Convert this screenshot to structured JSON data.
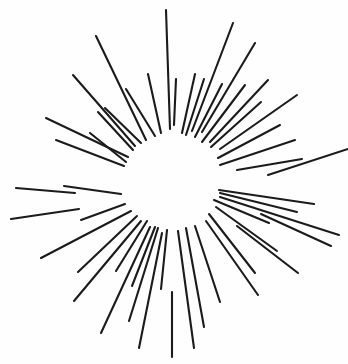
{
  "figure": {
    "kind": "radial-sunburst-line-drawing",
    "width": 348,
    "height": 364,
    "background_color": "#fefefe",
    "stroke_color": "#1b1b1b",
    "stroke_width": 2.1,
    "center": {
      "x": 172,
      "y": 182
    },
    "ray_count": 40,
    "inner_radius_range": [
      46,
      60
    ],
    "outer_radius_range": [
      78,
      175
    ]
  },
  "chart_data": {
    "type": "scatter",
    "subtitle": "",
    "xlabel": "",
    "ylabel": "",
    "grid": false,
    "legend": null,
    "xlim": [
      0,
      348
    ],
    "ylim": [
      0,
      364
    ],
    "center": {
      "x": 172,
      "y": 182
    },
    "units": "pixels",
    "angle_convention": "degrees, 0 = up (12 o'clock), increasing clockwise",
    "annotations": [],
    "rays": [
      {
        "angle": 358,
        "inner_r": 53,
        "outer_r": 172,
        "x1": 170,
        "y1": 129,
        "x2": 166,
        "y2": 10
      },
      {
        "angle": 2,
        "inner_r": 57,
        "outer_r": 103,
        "x1": 174,
        "y1": 125,
        "x2": 176,
        "y2": 79
      },
      {
        "angle": 12,
        "inner_r": 50,
        "outer_r": 110,
        "x1": 182,
        "y1": 133,
        "x2": 195,
        "y2": 74
      },
      {
        "angle": 17,
        "inner_r": 49,
        "outer_r": 108,
        "x1": 186,
        "y1": 135,
        "x2": 204,
        "y2": 79
      },
      {
        "angle": 21,
        "inner_r": 55,
        "outer_r": 170,
        "x1": 192,
        "y1": 131,
        "x2": 233,
        "y2": 23
      },
      {
        "angle": 27,
        "inner_r": 50,
        "outer_r": 110,
        "x1": 195,
        "y1": 137,
        "x2": 222,
        "y2": 84
      },
      {
        "angle": 31,
        "inner_r": 58,
        "outer_r": 162,
        "x1": 202,
        "y1": 132,
        "x2": 255,
        "y2": 43
      },
      {
        "angle": 37,
        "inner_r": 50,
        "outer_r": 122,
        "x1": 202,
        "y1": 142,
        "x2": 245,
        "y2": 85
      },
      {
        "angle": 43,
        "inner_r": 55,
        "outer_r": 140,
        "x1": 210,
        "y1": 142,
        "x2": 268,
        "y2": 80
      },
      {
        "angle": 48,
        "inner_r": 52,
        "outer_r": 120,
        "x1": 211,
        "y1": 147,
        "x2": 261,
        "y2": 102
      },
      {
        "angle": 55,
        "inner_r": 58,
        "outer_r": 152,
        "x1": 220,
        "y1": 149,
        "x2": 297,
        "y2": 95
      },
      {
        "angle": 62,
        "inner_r": 52,
        "outer_r": 122,
        "x1": 218,
        "y1": 158,
        "x2": 280,
        "y2": 125
      },
      {
        "angle": 71,
        "inner_r": 51,
        "outer_r": 130,
        "x1": 220,
        "y1": 165,
        "x2": 295,
        "y2": 140
      },
      {
        "angle": 80,
        "inner_r": 66,
        "outer_r": 132,
        "x1": 237,
        "y1": 170,
        "x2": 302,
        "y2": 159
      },
      {
        "angle": 86,
        "inner_r": 96,
        "outer_r": 176,
        "x1": 268,
        "y1": 175,
        "x2": 348,
        "y2": 149
      },
      {
        "angle": 99,
        "inner_r": 48,
        "outer_r": 144,
        "x1": 219,
        "y1": 190,
        "x2": 314,
        "y2": 204
      },
      {
        "angle": 103,
        "inner_r": 49,
        "outer_r": 128,
        "x1": 220,
        "y1": 193,
        "x2": 297,
        "y2": 212
      },
      {
        "angle": 107,
        "inner_r": 50,
        "outer_r": 175,
        "x1": 220,
        "y1": 197,
        "x2": 339,
        "y2": 235
      },
      {
        "angle": 110,
        "inner_r": 95,
        "outer_r": 170,
        "x1": 261,
        "y1": 214,
        "x2": 331,
        "y2": 246
      },
      {
        "angle": 113,
        "inner_r": 46,
        "outer_r": 106,
        "x1": 214,
        "y1": 200,
        "x2": 269,
        "y2": 223
      },
      {
        "angle": 119,
        "inner_r": 50,
        "outer_r": 122,
        "x1": 216,
        "y1": 207,
        "x2": 277,
        "y2": 251
      },
      {
        "angle": 125,
        "inner_r": 80,
        "outer_r": 155,
        "x1": 237,
        "y1": 226,
        "x2": 298,
        "y2": 273
      },
      {
        "angle": 131,
        "inner_r": 49,
        "outer_r": 112,
        "x1": 209,
        "y1": 214,
        "x2": 255,
        "y2": 273
      },
      {
        "angle": 139,
        "inner_r": 52,
        "outer_r": 130,
        "x1": 206,
        "y1": 221,
        "x2": 258,
        "y2": 295
      },
      {
        "angle": 152,
        "inner_r": 50,
        "outer_r": 136,
        "x1": 195,
        "y1": 226,
        "x2": 220,
        "y2": 302
      },
      {
        "angle": 163,
        "inner_r": 48,
        "outer_r": 152,
        "x1": 186,
        "y1": 228,
        "x2": 204,
        "y2": 327
      },
      {
        "angle": 173,
        "inner_r": 50,
        "outer_r": 170,
        "x1": 178,
        "y1": 231,
        "x2": 194,
        "y2": 348
      },
      {
        "angle": 180,
        "inner_r": 110,
        "outer_r": 175,
        "x1": 172,
        "y1": 292,
        "x2": 172,
        "y2": 357
      },
      {
        "angle": 186,
        "inner_r": 48,
        "outer_r": 108,
        "x1": 167,
        "y1": 230,
        "x2": 161,
        "y2": 289
      },
      {
        "angle": 191,
        "inner_r": 52,
        "outer_r": 170,
        "x1": 162,
        "y1": 233,
        "x2": 139,
        "y2": 348
      },
      {
        "angle": 197,
        "inner_r": 48,
        "outer_r": 146,
        "x1": 158,
        "y1": 228,
        "x2": 129,
        "y2": 321
      },
      {
        "angle": 201,
        "inner_r": 48,
        "outer_r": 112,
        "x1": 155,
        "y1": 227,
        "x2": 132,
        "y2": 286
      },
      {
        "angle": 206,
        "inner_r": 50,
        "outer_r": 168,
        "x1": 150,
        "y1": 227,
        "x2": 101,
        "y2": 333
      },
      {
        "angle": 213,
        "inner_r": 46,
        "outer_r": 106,
        "x1": 147,
        "y1": 221,
        "x2": 116,
        "y2": 271
      },
      {
        "angle": 219,
        "inner_r": 50,
        "outer_r": 155,
        "x1": 141,
        "y1": 221,
        "x2": 74,
        "y2": 301
      },
      {
        "angle": 226,
        "inner_r": 49,
        "outer_r": 130,
        "x1": 137,
        "y1": 216,
        "x2": 78,
        "y2": 272
      },
      {
        "angle": 234,
        "inner_r": 50,
        "outer_r": 162,
        "x1": 131,
        "y1": 211,
        "x2": 41,
        "y2": 258
      },
      {
        "angle": 245,
        "inner_r": 52,
        "outer_r": 100,
        "x1": 125,
        "y1": 204,
        "x2": 81,
        "y2": 220
      },
      {
        "angle": 248,
        "inner_r": 100,
        "outer_r": 174,
        "x1": 79,
        "y1": 209,
        "x2": 11,
        "y2": 219
      },
      {
        "angle": 257,
        "inner_r": 52,
        "outer_r": 110,
        "x1": 121,
        "y1": 194,
        "x2": 64,
        "y2": 186
      },
      {
        "angle": 259,
        "inner_r": 100,
        "outer_r": 172,
        "x1": 75,
        "y1": 193,
        "x2": 16,
        "y2": 188
      },
      {
        "angle": 281,
        "inner_r": 50,
        "outer_r": 120,
        "x1": 124,
        "y1": 166,
        "x2": 56,
        "y2": 140
      },
      {
        "angle": 289,
        "inner_r": 50,
        "outer_r": 112,
        "x1": 126,
        "y1": 162,
        "x2": 90,
        "y2": 133
      },
      {
        "angle": 297,
        "inner_r": 52,
        "outer_r": 150,
        "x1": 128,
        "y1": 157,
        "x2": 46,
        "y2": 118
      },
      {
        "angle": 306,
        "inner_r": 50,
        "outer_r": 120,
        "x1": 133,
        "y1": 150,
        "x2": 98,
        "y2": 112
      },
      {
        "angle": 314,
        "inner_r": 52,
        "outer_r": 148,
        "x1": 135,
        "y1": 146,
        "x2": 73,
        "y2": 75
      },
      {
        "angle": 322,
        "inner_r": 50,
        "outer_r": 108,
        "x1": 141,
        "y1": 143,
        "x2": 105,
        "y2": 108
      },
      {
        "angle": 330,
        "inner_r": 52,
        "outer_r": 156,
        "x1": 146,
        "y1": 140,
        "x2": 96,
        "y2": 36
      },
      {
        "angle": 340,
        "inner_r": 50,
        "outer_r": 110,
        "x1": 155,
        "y1": 136,
        "x2": 126,
        "y2": 89
      },
      {
        "angle": 348,
        "inner_r": 54,
        "outer_r": 112,
        "x1": 161,
        "y1": 133,
        "x2": 148,
        "y2": 74
      }
    ]
  }
}
